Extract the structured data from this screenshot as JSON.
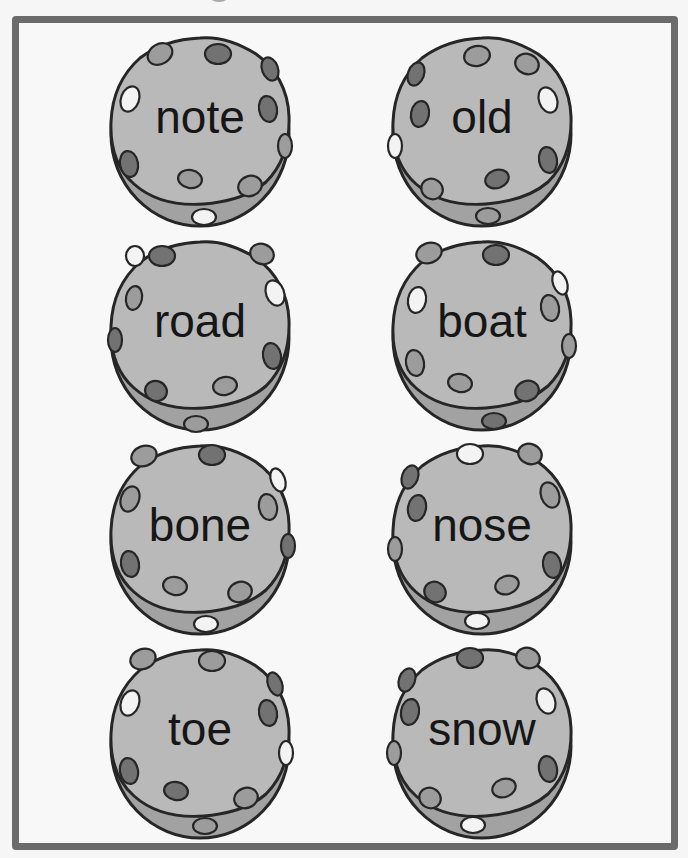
{
  "colors": {
    "frame": "#6b6b6b",
    "page": "#f8f8f8",
    "cookie_face": "#b9b9b9",
    "cookie_rim": "#a2a2a2",
    "outline": "#262626",
    "spot_dark": "#727272",
    "spot_mid": "#9c9c9c",
    "spot_light": "#f3f3f3"
  },
  "cookies": [
    {
      "word": "note",
      "row": 1,
      "col": 1
    },
    {
      "word": "old",
      "row": 1,
      "col": 2
    },
    {
      "word": "road",
      "row": 2,
      "col": 1
    },
    {
      "word": "boat",
      "row": 2,
      "col": 2
    },
    {
      "word": "bone",
      "row": 3,
      "col": 1
    },
    {
      "word": "nose",
      "row": 3,
      "col": 2
    },
    {
      "word": "toe",
      "row": 4,
      "col": 1
    },
    {
      "word": "snow",
      "row": 4,
      "col": 2
    }
  ]
}
